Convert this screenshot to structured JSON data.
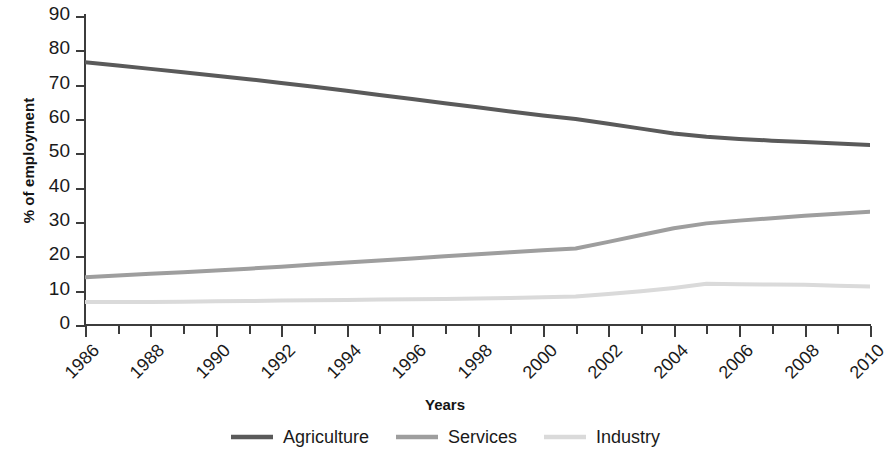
{
  "chart_data": {
    "type": "line",
    "title": "",
    "xlabel": "Years",
    "ylabel": "% of employment",
    "xlim": [
      1986,
      2010
    ],
    "ylim": [
      0,
      90
    ],
    "ytick_step": 10,
    "xtick_step": 2,
    "xtick_minor_step": 1,
    "grid": false,
    "legend_position": "bottom",
    "x": [
      1986,
      1987,
      1988,
      1989,
      1990,
      1991,
      1992,
      1993,
      1994,
      1995,
      1996,
      1997,
      1998,
      1999,
      2000,
      2001,
      2002,
      2003,
      2004,
      2005,
      2006,
      2007,
      2008,
      2009,
      2010
    ],
    "ytick_labels": [
      "90",
      "80",
      "70",
      "60",
      "50",
      "40",
      "30",
      "20",
      "10",
      "0"
    ],
    "ytick_values": [
      90,
      80,
      70,
      60,
      50,
      40,
      30,
      20,
      10,
      0
    ],
    "xtick_labels": [
      "1986",
      "1988",
      "1990",
      "1992",
      "1994",
      "1996",
      "1998",
      "2000",
      "2002",
      "2004",
      "2006",
      "2008",
      "2010"
    ],
    "xtick_values": [
      1986,
      1988,
      1990,
      1992,
      1994,
      1996,
      1998,
      2000,
      2002,
      2004,
      2006,
      2008,
      2010
    ],
    "series": [
      {
        "name": "Agriculture",
        "color": "#5a5a5a",
        "width": 4,
        "values": [
          76.5,
          75.6,
          74.6,
          73.6,
          72.6,
          71.6,
          70.5,
          69.4,
          68.2,
          67.0,
          65.8,
          64.6,
          63.4,
          62.2,
          61.0,
          60.0,
          58.6,
          57.2,
          55.8,
          54.8,
          54.2,
          53.7,
          53.3,
          52.9,
          52.4
        ]
      },
      {
        "name": "Services",
        "color": "#9e9e9e",
        "width": 4,
        "values": [
          13.9,
          14.4,
          14.9,
          15.4,
          15.9,
          16.4,
          17.0,
          17.6,
          18.2,
          18.8,
          19.4,
          20.0,
          20.6,
          21.2,
          21.8,
          22.3,
          24.2,
          26.2,
          28.2,
          29.6,
          30.4,
          31.1,
          31.8,
          32.4,
          33.0
        ]
      },
      {
        "name": "Industry",
        "color": "#dadada",
        "width": 4,
        "values": [
          6.7,
          6.7,
          6.7,
          6.8,
          6.9,
          7.0,
          7.1,
          7.2,
          7.3,
          7.4,
          7.5,
          7.6,
          7.7,
          7.9,
          8.1,
          8.3,
          9.0,
          9.8,
          10.8,
          12.0,
          11.9,
          11.8,
          11.7,
          11.4,
          11.2
        ]
      }
    ]
  },
  "legend": {
    "items": [
      {
        "label": "Agriculture",
        "color": "#5a5a5a"
      },
      {
        "label": "Services",
        "color": "#9e9e9e"
      },
      {
        "label": "Industry",
        "color": "#dadada"
      }
    ]
  }
}
